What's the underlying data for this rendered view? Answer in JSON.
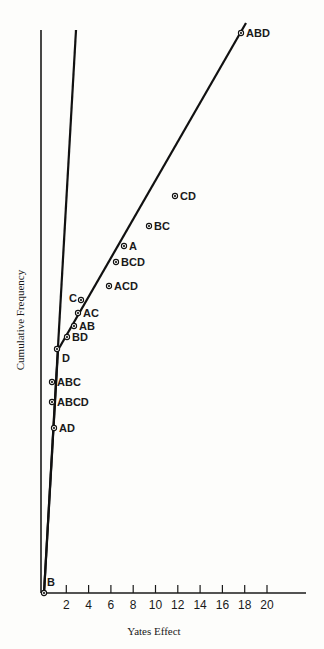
{
  "chart_data": {
    "type": "scatter",
    "title": "",
    "xlabel": "Yates Effect",
    "ylabel": "Cumulative Frequency",
    "xlim": [
      0,
      23
    ],
    "x_ticks": [
      2,
      4,
      6,
      8,
      10,
      12,
      14,
      16,
      18,
      20
    ],
    "grid": false,
    "legend": null,
    "points": [
      {
        "label": "B",
        "x": 0.0,
        "px": [
          44,
          593
        ]
      },
      {
        "label": "AD",
        "x": 0.9,
        "px": [
          54,
          428
        ]
      },
      {
        "label": "ABCD",
        "x": 0.7,
        "px": [
          52,
          402
        ]
      },
      {
        "label": "ABC",
        "x": 0.7,
        "px": [
          52,
          382
        ]
      },
      {
        "label": "D",
        "x": 1.2,
        "px": [
          57,
          349
        ]
      },
      {
        "label": "BD",
        "x": 2.1,
        "px": [
          67,
          337
        ]
      },
      {
        "label": "AB",
        "x": 2.7,
        "px": [
          74,
          326
        ]
      },
      {
        "label": "AC",
        "x": 3.1,
        "px": [
          78,
          313
        ]
      },
      {
        "label": "C",
        "x": 3.3,
        "px": [
          81,
          300
        ]
      },
      {
        "label": "ACD",
        "x": 5.8,
        "px": [
          109,
          286
        ]
      },
      {
        "label": "BCD",
        "x": 6.5,
        "px": [
          116,
          262
        ]
      },
      {
        "label": "A",
        "x": 7.2,
        "px": [
          124,
          246
        ]
      },
      {
        "label": "BC",
        "x": 9.4,
        "px": [
          149,
          226
        ]
      },
      {
        "label": "CD",
        "x": 11.7,
        "px": [
          175,
          196
        ]
      },
      {
        "label": "ABD",
        "x": 17.7,
        "px": [
          241,
          33
        ]
      }
    ],
    "fitted_lines": [
      {
        "name": "steep-line",
        "from_px": [
          44,
          593
        ],
        "to_px": [
          76,
          30
        ]
      },
      {
        "name": "shallow-line",
        "from_px": [
          58,
          350
        ],
        "to_px": [
          246,
          23
        ]
      },
      {
        "name": "lower-segment",
        "from_px": [
          44,
          593
        ],
        "to_px": [
          58,
          350
        ]
      }
    ]
  }
}
